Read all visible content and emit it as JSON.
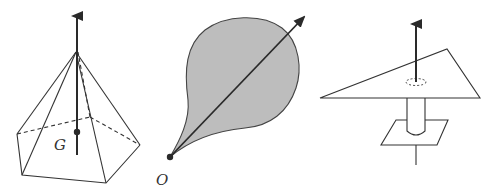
{
  "figure": {
    "panels": [
      {
        "id": "pyramid",
        "description": "Pentagonal pyramid with vertical arrow through apex and center of gravity",
        "labels": {
          "center_of_gravity": "G"
        }
      },
      {
        "id": "teardrop",
        "description": "Shaded teardrop-shaped lamina pivoted at point O with arrow along its axis",
        "labels": {
          "origin": "O"
        }
      },
      {
        "id": "triangle-on-post",
        "description": "Triangular plate balanced on a cylindrical post on a base plate with vertical arrow"
      }
    ],
    "colors": {
      "stroke": "#333333",
      "arrow": "#2a2a2a",
      "fill_shaded": "#bdbdbd",
      "background": "#ffffff"
    }
  }
}
